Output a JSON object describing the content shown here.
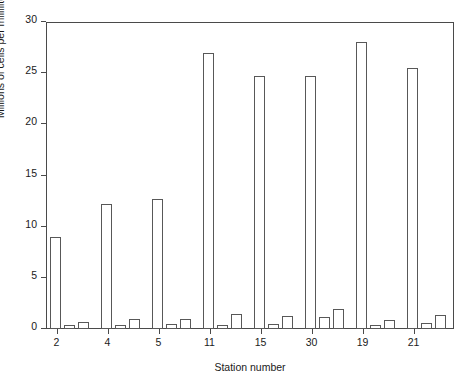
{
  "chart_data": {
    "type": "bar",
    "title": "",
    "subtitle": "",
    "xlabel": "Station number",
    "ylabel": "Millions of cells per milliliter",
    "categories": [
      "2",
      "4",
      "5",
      "11",
      "15",
      "30",
      "19",
      "21"
    ],
    "ylim": [
      0,
      30
    ],
    "yticks": [
      0,
      5,
      10,
      15,
      20,
      25,
      30
    ],
    "ytick_labels": [
      "0",
      "5",
      "10",
      "15",
      "20",
      "25",
      "30"
    ],
    "grid": false,
    "legend": "none",
    "series": [
      {
        "name": "bar-1",
        "values": [
          9.0,
          12.2,
          12.7,
          27.0,
          24.7,
          24.7,
          28.0,
          25.5
        ]
      },
      {
        "name": "bar-2",
        "values": [
          0.35,
          0.4,
          0.45,
          0.4,
          0.5,
          1.2,
          0.4,
          0.6
        ]
      },
      {
        "name": "bar-3",
        "values": [
          0.7,
          0.95,
          0.95,
          1.45,
          1.3,
          2.0,
          0.85,
          1.4
        ]
      }
    ]
  },
  "axes": {
    "y_title": "Millions of cells per milliliter",
    "x_title": "Station number",
    "y_tick_labels": [
      "30",
      "25",
      "20",
      "15",
      "10",
      "5",
      "0"
    ],
    "x_tick_labels": [
      "2",
      "4",
      "5",
      "11",
      "15",
      "30",
      "19",
      "21"
    ]
  },
  "colors": {
    "bar_stroke": "#585858",
    "bar_fill": "#ffffff",
    "axis": "#4a4a4a",
    "text": "#1a1a1a",
    "background": "#ffffff"
  }
}
